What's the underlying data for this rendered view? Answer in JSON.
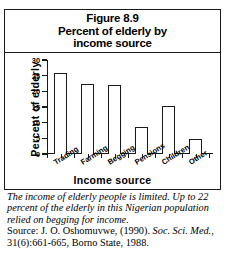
{
  "figure": {
    "title_lines": [
      "Figure 8.9",
      "Percent of elderly by",
      "income source"
    ]
  },
  "chart_data": {
    "type": "bar",
    "title": "Figure 8.9 Percent of elderly by income source",
    "categories": [
      "Trading",
      "Farming",
      "Begging",
      "Pensions",
      "Children",
      "Other"
    ],
    "values": [
      26,
      22.5,
      22,
      8.7,
      15.3,
      4.7
    ],
    "xlabel": "Income  source",
    "ylabel": "Percent of elderly",
    "ylim": [
      0,
      30
    ],
    "yticks": [
      0,
      5,
      10,
      15,
      20,
      25,
      30
    ],
    "ytick_labels": [
      "0",
      "5",
      "10",
      "15",
      "20",
      "25",
      "30"
    ],
    "grid": false,
    "legend": "none",
    "bar_style": {
      "fill": "#ffffff",
      "edge": "#1a1a1a"
    }
  },
  "caption": {
    "body": "The income of elderly people is limited.  Up to 22 percent of the elderly in this Nigerian population relied on begging for income.",
    "source_prefix": "Source:  J. O. Oshomuvwe, (1990).  ",
    "source_journal": "Soc. Sci. Med.",
    "source_rest": ", 31(6):661-665,  Borno State, 1988."
  }
}
